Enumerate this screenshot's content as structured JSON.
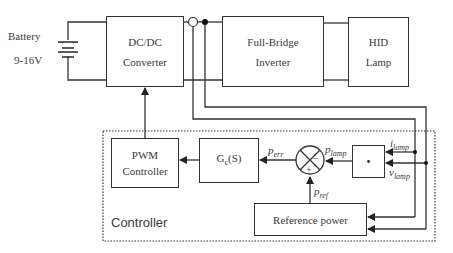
{
  "power_stage": {
    "battery": {
      "label": "Battery",
      "voltage": "9-16V"
    },
    "dcdc": {
      "line1": "DC/DC",
      "line2": "Converter"
    },
    "inverter": {
      "line1": "Full-Bridge",
      "line2": "Inverter"
    },
    "lamp": {
      "line1": "HID",
      "line2": "Lamp"
    }
  },
  "controller": {
    "title": "Controller",
    "pwm": {
      "line1": "PWM",
      "line2": "Controller"
    },
    "gc": {
      "label": "G",
      "sub": "c",
      "suffix": "(S)"
    },
    "multiplier": {
      "label": "·"
    },
    "reference": {
      "label": "Reference power"
    },
    "junction": {
      "minus": "−",
      "plus": "+"
    }
  },
  "signals": {
    "p_err": {
      "base": "p",
      "sub": "err"
    },
    "p_lamp": {
      "base": "p",
      "sub": "lamp"
    },
    "p_ref": {
      "base": "p",
      "sub": "ref"
    },
    "i_lamp": {
      "base": "i",
      "sub": "lamp"
    },
    "v_lamp": {
      "base": "v",
      "sub": "lamp"
    }
  },
  "colors": {
    "line": "#333333",
    "text": "#3a3a3a",
    "background": "#ffffff"
  }
}
